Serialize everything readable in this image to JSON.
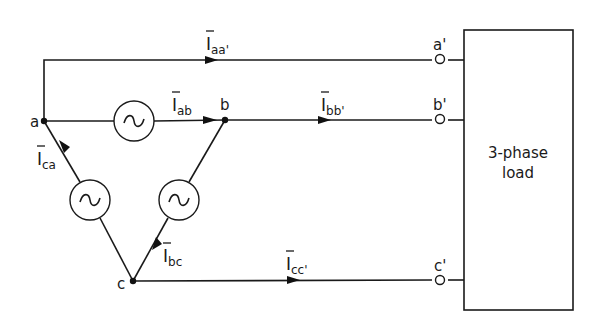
{
  "diagram": {
    "nodes": {
      "a": "a",
      "b": "b",
      "c": "c"
    },
    "terminals": {
      "a_prime": "a'",
      "b_prime": "b'",
      "c_prime": "c'"
    },
    "currents": {
      "aa": {
        "symbol": "I",
        "subscript": "aa'"
      },
      "ab": {
        "symbol": "I",
        "subscript": "ab"
      },
      "bb": {
        "symbol": "I",
        "subscript": "bb'"
      },
      "ca": {
        "symbol": "I",
        "subscript": "ca"
      },
      "bc": {
        "symbol": "I",
        "subscript": "bc"
      },
      "cc": {
        "symbol": "I",
        "subscript": "cc'"
      }
    },
    "sources": [
      {
        "id": "source-ab",
        "icon": "ac-source-icon",
        "between": "a-b"
      },
      {
        "id": "source-ca",
        "icon": "ac-source-icon",
        "between": "c-a"
      },
      {
        "id": "source-bc",
        "icon": "ac-source-icon",
        "between": "b-c"
      }
    ],
    "load": {
      "line1": "3-phase",
      "line2": "load"
    }
  }
}
